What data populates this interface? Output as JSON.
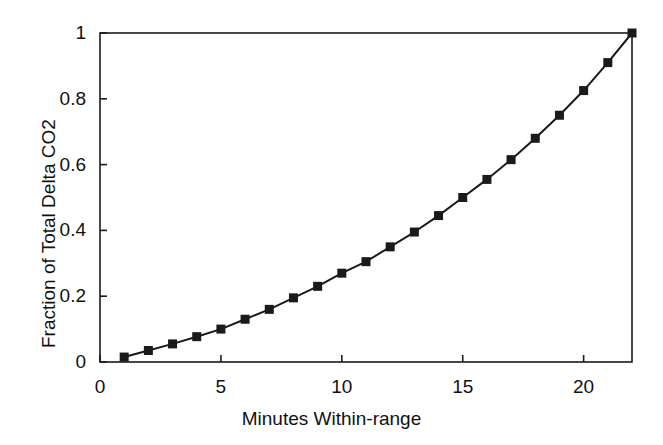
{
  "chart_data": {
    "type": "line",
    "title": "",
    "subtitle": "",
    "xlabel": "Minutes Within-range",
    "ylabel": "Fraction of Total Delta CO2",
    "xlim": [
      0,
      22
    ],
    "ylim": [
      0,
      1
    ],
    "xticks": [
      0,
      5,
      10,
      15,
      20
    ],
    "xticklabels": [
      "0",
      "5",
      "10",
      "15",
      "20"
    ],
    "yticks": [
      0,
      0.2,
      0.4,
      0.6,
      0.8,
      1
    ],
    "yticklabels": [
      "0",
      "0.2",
      "0.4",
      "0.6",
      "0.8",
      "1"
    ],
    "grid": false,
    "legend": null,
    "marker": "filled-square",
    "line_color": "#1a1a1a",
    "marker_color": "#1a1a1a",
    "x": [
      1,
      2,
      3,
      4,
      5,
      6,
      7,
      8,
      9,
      10,
      11,
      12,
      13,
      14,
      15,
      16,
      17,
      18,
      19,
      20,
      21,
      22
    ],
    "values": [
      0.015,
      0.035,
      0.055,
      0.077,
      0.1,
      0.13,
      0.16,
      0.195,
      0.23,
      0.27,
      0.305,
      0.35,
      0.395,
      0.445,
      0.5,
      0.555,
      0.615,
      0.68,
      0.75,
      0.825,
      0.91,
      1.0
    ],
    "series": [
      {
        "name": "Fraction of Total Delta CO2",
        "values": [
          0.015,
          0.035,
          0.055,
          0.077,
          0.1,
          0.13,
          0.16,
          0.195,
          0.23,
          0.27,
          0.305,
          0.35,
          0.395,
          0.445,
          0.5,
          0.555,
          0.615,
          0.68,
          0.75,
          0.825,
          0.91,
          1.0
        ]
      }
    ]
  },
  "figure": {
    "xlabel": "Minutes Within-range",
    "ylabel": "Fraction of Total Delta CO2"
  },
  "yticklabels": {
    "t0": "0",
    "t1": "0.2",
    "t2": "0.4",
    "t3": "0.6",
    "t4": "0.8",
    "t5": "1"
  },
  "xticklabels": {
    "t0": "0",
    "t1": "5",
    "t2": "10",
    "t3": "15",
    "t4": "20"
  }
}
